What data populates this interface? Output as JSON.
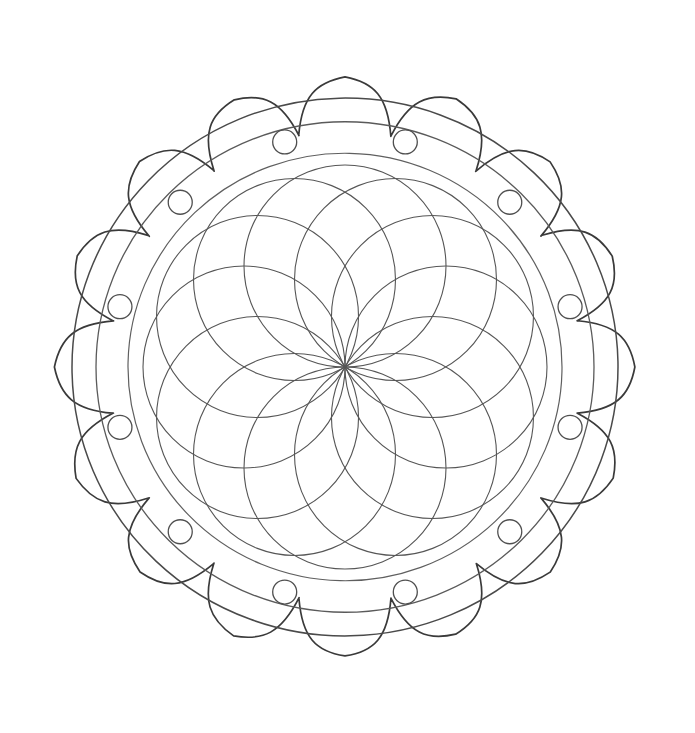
{
  "artwork": {
    "title": "Lotus Mandala Coloring Page",
    "subject": "mandala",
    "style": "line-art-coloring-page",
    "background_color": "#ffffff",
    "canvas": {
      "width": 695,
      "height": 733
    }
  },
  "geometry": {
    "center": {
      "x": 345,
      "y": 367
    },
    "stroke_colors": {
      "petal_outline": "#3a3a3a",
      "outer_ring": "#4a4a4a",
      "mid_ring": "#5a5a5a",
      "inner_ring": "#5f5f5f",
      "dot_circle": "#4f4f4f",
      "rose_circle": "#565656"
    },
    "stroke_widths": {
      "petal_outline": 1.7,
      "outer_ring": 1.5,
      "mid_ring": 1.3,
      "inner_ring": 1.2,
      "dot_circle": 1.3,
      "rose_circle": 1.1
    }
  },
  "layers": {
    "lotus_petals": {
      "name": "outer-lotus-petals",
      "count": 16,
      "tip_radius": 290,
      "notch_radius": 236,
      "shoulder_radius": 268,
      "rotation_offset_deg": -90
    },
    "outer_ring": {
      "name": "outer-band-ring",
      "radius": 273
    },
    "mid_ring": {
      "name": "mid-band-ring",
      "radius": 249
    },
    "inner_ring": {
      "name": "inner-band-ring",
      "radius": 217
    },
    "dots": {
      "name": "small-circle-dots",
      "count": 12,
      "orbit_radius": 233,
      "dot_radius": 12,
      "rotation_offset_deg": -75
    },
    "rosette": {
      "name": "central-rosette",
      "circle_count": 12,
      "circle_radius": 101,
      "orbit_radius": 101,
      "rotation_offset_deg": -90,
      "description": "twelve equal circles whose centers lie on a ring of the same radius, so every circle passes through the exact center point, forming a twelve-lobed rose"
    }
  },
  "chart_data": {
    "type": "scatter",
    "xlabel": "",
    "ylabel": "",
    "categories": [
      "lotus-petals",
      "outer-band-ring",
      "mid-band-ring",
      "inner-band-ring",
      "small-circle-dots",
      "central-rosette"
    ],
    "values": [
      16,
      1,
      1,
      1,
      12,
      12
    ],
    "xlim": [
      0,
      695
    ],
    "ylim": [
      0,
      733
    ],
    "grid": false,
    "legend": "none"
  }
}
